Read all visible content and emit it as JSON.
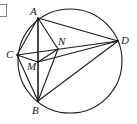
{
  "figure": {
    "type": "geometry-diagram",
    "circle": {
      "cx": 70,
      "cy": 61,
      "r": 52
    },
    "points": {
      "A": {
        "x": 38,
        "y": 18,
        "label": "A",
        "lx": 30,
        "ly": 15
      },
      "B": {
        "x": 38,
        "y": 101,
        "label": "B",
        "lx": 32,
        "ly": 114
      },
      "C": {
        "x": 17,
        "y": 55,
        "label": "C",
        "lx": 6,
        "ly": 58
      },
      "D": {
        "x": 118,
        "y": 41,
        "label": "D",
        "lx": 121,
        "ly": 44
      },
      "M": {
        "x": 38,
        "y": 62,
        "label": "M",
        "lx": 27,
        "ly": 70
      },
      "N": {
        "x": 58,
        "y": 49,
        "label": "N",
        "lx": 58,
        "ly": 45
      }
    },
    "segments": [
      [
        "A",
        "B"
      ],
      [
        "A",
        "C"
      ],
      [
        "A",
        "D"
      ],
      [
        "A",
        "N"
      ],
      [
        "A",
        "M"
      ],
      [
        "C",
        "D"
      ],
      [
        "C",
        "M"
      ],
      [
        "C",
        "B"
      ],
      [
        "M",
        "N"
      ],
      [
        "M",
        "D"
      ],
      [
        "M",
        "B"
      ],
      [
        "N",
        "B"
      ],
      [
        "B",
        "D"
      ]
    ],
    "labels": [
      "A",
      "B",
      "C",
      "D",
      "M",
      "N"
    ]
  }
}
